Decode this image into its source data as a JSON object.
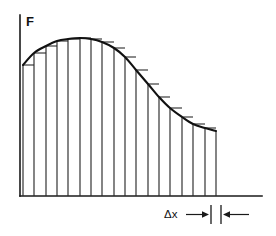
{
  "figure": {
    "axis_label_y": "F",
    "dimension_label": "Δx",
    "background_color": "#ffffff",
    "line_color": "#111111",
    "curve_color": "#111111"
  },
  "chart_data": {
    "type": "area",
    "xlabel": "",
    "ylabel": "F",
    "grid": false,
    "legend": null,
    "annotations": [
      {
        "text": "Δx",
        "meaning": "width of one rectangle strip",
        "x_px": 172,
        "y_px": 214
      },
      {
        "text": "F",
        "meaning": "vertical axis label (force / function value)",
        "x_px": 26,
        "y_px": 21
      }
    ],
    "axis_geometry": {
      "y_axis_x_px": 20,
      "y_axis_top_px": 15,
      "baseline_y_px": 196,
      "x_axis_left_px": 20,
      "x_axis_right_px": 262
    },
    "rectangles": {
      "count": 17,
      "delta_x_px": 11.35,
      "first_edge_x_px": 23,
      "last_edge_x_px": 216,
      "rule": "left-endpoint heights stepped to follow the curve"
    },
    "curve": {
      "description": "smooth hump: rises from left edge to a rounded peak then decays to a low plateau on the right",
      "x": [
        23,
        34,
        46,
        57,
        68,
        80,
        91,
        102,
        114,
        125,
        136,
        148,
        159,
        170,
        182,
        193,
        205,
        216
      ],
      "y": [
        65,
        53,
        46,
        41,
        39,
        38,
        39,
        42,
        48,
        57,
        70,
        84,
        97,
        108,
        117,
        124,
        128,
        131
      ],
      "y_note": "pixel y measured from top; baseline at y=196 so larger y means smaller value"
    },
    "series": [
      {
        "name": "F(x)",
        "x": [
          0,
          1,
          2,
          3,
          4,
          5,
          6,
          7,
          8,
          9,
          10,
          11,
          12,
          13,
          14,
          15,
          16,
          17
        ],
        "values": [
          131,
          143,
          150,
          155,
          157,
          158,
          157,
          154,
          148,
          139,
          126,
          112,
          99,
          88,
          79,
          72,
          68,
          65
        ],
        "values_note": "heights above the baseline in pixels"
      }
    ],
    "xlim": [
      0,
      17
    ],
    "ylim": [
      0,
      181
    ]
  }
}
